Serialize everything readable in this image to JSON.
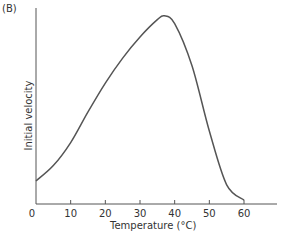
{
  "chart_data": {
    "type": "line",
    "panel_label": "(B)",
    "title": "",
    "xlabel": "Temperature (°C)",
    "ylabel": "Initial velocity",
    "xlim": [
      0,
      68
    ],
    "x_ticks": [
      0,
      10,
      20,
      30,
      40,
      50,
      60
    ],
    "y_ticks": [],
    "grid": false,
    "legend": null,
    "series": [
      {
        "name": "Initial velocity",
        "x": [
          0,
          5,
          10,
          15,
          20,
          25,
          30,
          35,
          37,
          40,
          45,
          50,
          55,
          60
        ],
        "y": [
          0.12,
          0.2,
          0.32,
          0.48,
          0.63,
          0.76,
          0.87,
          0.96,
          0.98,
          0.94,
          0.72,
          0.38,
          0.1,
          0.02
        ]
      }
    ],
    "annotations": [
      "Peak initial velocity at ~37 °C"
    ]
  }
}
